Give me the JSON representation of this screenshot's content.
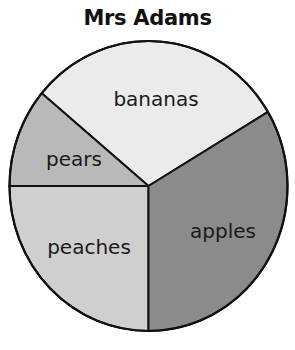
{
  "chart_data": {
    "type": "pie",
    "title": "Mrs Adams",
    "categories": [
      "bananas",
      "apples",
      "peaches",
      "pears"
    ],
    "values": [
      30.4,
      33.6,
      25.0,
      11.0
    ],
    "units": "percent (estimated from slice angles)",
    "slices": [
      {
        "label": "bananas",
        "value": 30.4,
        "start_deg": 30.7,
        "end_deg": 140.2,
        "color": "#ebebeb"
      },
      {
        "label": "pears",
        "value": 11.0,
        "start_deg": 140.2,
        "end_deg": 180.0,
        "color": "#b9b9b9"
      },
      {
        "label": "peaches",
        "value": 25.0,
        "start_deg": 180.0,
        "end_deg": 270.0,
        "color": "#cfcfcf"
      },
      {
        "label": "apples",
        "value": 33.6,
        "start_deg": 270.0,
        "end_deg": 390.7,
        "color": "#8b8b8b"
      }
    ],
    "legend": "none (labels drawn inside slices)",
    "xlabel": "",
    "ylabel": ""
  },
  "title": "Mrs Adams",
  "labels": {
    "bananas": "bananas",
    "pears": "pears",
    "peaches": "peaches",
    "apples": "apples"
  }
}
